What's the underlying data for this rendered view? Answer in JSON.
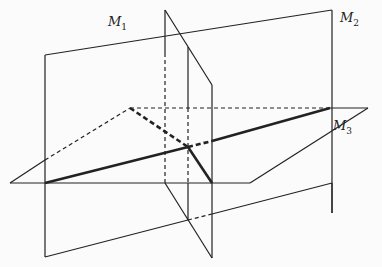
{
  "diagram": {
    "title": "",
    "planes": [
      {
        "id": "M1",
        "label": "M",
        "subscript": "1",
        "label_pos": [
          108,
          22
        ]
      },
      {
        "id": "M2",
        "label": "M",
        "subscript": "2",
        "label_pos": [
          340,
          18
        ]
      },
      {
        "id": "M3",
        "label": "M",
        "subscript": "3",
        "label_pos": [
          333,
          120
        ]
      }
    ],
    "colors": {
      "stroke": "#222222",
      "background": "#fbfbfb"
    }
  }
}
